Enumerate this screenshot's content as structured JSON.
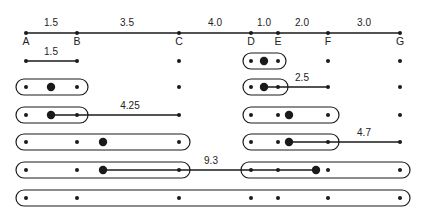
{
  "points": [
    {
      "label": "A",
      "x": 26
    },
    {
      "label": "B",
      "x": 77
    },
    {
      "label": "C",
      "x": 179
    },
    {
      "label": "D",
      "x": 251
    },
    {
      "label": "E",
      "x": 278
    },
    {
      "label": "F",
      "x": 328
    },
    {
      "label": "G",
      "x": 400
    }
  ],
  "axis": {
    "y": 33,
    "gaps": [
      {
        "text": "1.5",
        "x": 51
      },
      {
        "text": "3.5",
        "x": 127
      },
      {
        "text": "4.0",
        "x": 215
      },
      {
        "text": "1.0",
        "x": 264
      },
      {
        "text": "2.0",
        "x": 302
      },
      {
        "text": "3.0",
        "x": 364
      }
    ]
  },
  "steps": [
    {
      "y": 61,
      "clusters": [
        {
          "members": [
            "D",
            "E"
          ],
          "x1": 243,
          "x2": 286,
          "centroid": 264
        }
      ],
      "merge": {
        "from": 26,
        "to": 77,
        "label": "1.5",
        "label_x": 51
      }
    },
    {
      "y": 87,
      "clusters": [
        {
          "members": [
            "A",
            "B"
          ],
          "x1": 16,
          "x2": 88,
          "centroid": 51
        },
        {
          "members": [
            "D",
            "E"
          ],
          "x1": 243,
          "x2": 288,
          "centroid": 264
        }
      ],
      "merge": {
        "from": 264,
        "to": 328,
        "label": "2.5",
        "label_x": 302
      }
    },
    {
      "y": 115,
      "clusters": [
        {
          "members": [
            "A",
            "B"
          ],
          "x1": 16,
          "x2": 88,
          "centroid": 51
        },
        {
          "members": [
            "D",
            "E",
            "F"
          ],
          "x1": 243,
          "x2": 339,
          "centroid": 289
        }
      ],
      "merge": {
        "from": 51,
        "to": 179,
        "label": "4.25",
        "label_x": 130
      }
    },
    {
      "y": 142,
      "clusters": [
        {
          "members": [
            "A",
            "B",
            "C"
          ],
          "x1": 16,
          "x2": 190,
          "centroid": 103
        },
        {
          "members": [
            "D",
            "E",
            "F"
          ],
          "x1": 243,
          "x2": 339,
          "centroid": 289
        }
      ],
      "merge": {
        "from": 289,
        "to": 400,
        "label": "4.7",
        "label_x": 364
      }
    },
    {
      "y": 170,
      "clusters": [
        {
          "members": [
            "A",
            "B",
            "C"
          ],
          "x1": 16,
          "x2": 190,
          "centroid": 103
        },
        {
          "members": [
            "D",
            "E",
            "F",
            "G"
          ],
          "x1": 241,
          "x2": 410,
          "centroid": 316
        }
      ],
      "merge": {
        "from": 103,
        "to": 316,
        "label": "9.3",
        "label_x": 211
      }
    },
    {
      "y": 198,
      "clusters": [
        {
          "members": [
            "A",
            "B",
            "C",
            "D",
            "E",
            "F",
            "G"
          ],
          "x1": 16,
          "x2": 410,
          "centroid": null
        }
      ],
      "merge": null
    }
  ],
  "colors": {
    "ink": "#1a1a1a",
    "background": "#ffffff"
  }
}
